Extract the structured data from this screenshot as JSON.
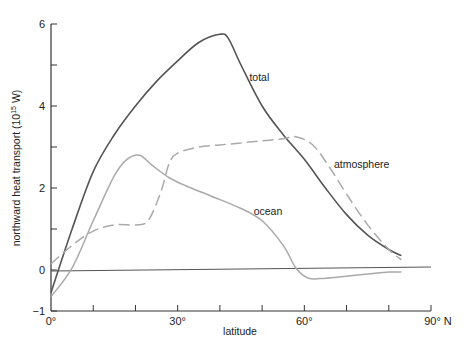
{
  "chart_data": {
    "type": "line",
    "title": "",
    "xlabel": "latitude",
    "ylabel": "northward heat transport (10^15 W)",
    "ylabel_parts": {
      "main": "northward heat transport (10",
      "sup": "15",
      "tail": " W)"
    },
    "xlim": [
      0,
      90
    ],
    "ylim": [
      -1,
      6
    ],
    "x_ticks": [
      0,
      10,
      20,
      30,
      40,
      50,
      60,
      70,
      80,
      90
    ],
    "x_tick_labels": [
      {
        "x": 0,
        "label": "0°"
      },
      {
        "x": 30,
        "label": "30°"
      },
      {
        "x": 60,
        "label": "60°"
      },
      {
        "x": 90,
        "label": "90° N"
      }
    ],
    "y_ticks": [
      -1,
      0,
      1,
      2,
      3,
      4,
      5,
      6
    ],
    "y_tick_labels": [
      {
        "y": -1,
        "label": "−1"
      },
      {
        "y": 0,
        "label": "0"
      },
      {
        "y": 2,
        "label": "2"
      },
      {
        "y": 4,
        "label": "4"
      },
      {
        "y": 6,
        "label": "6"
      }
    ],
    "grid": false,
    "legend": "inline labels",
    "series": [
      {
        "name": "total",
        "color": "#555555",
        "style": "solid",
        "x": [
          0,
          5,
          10,
          15,
          20,
          25,
          30,
          35,
          40,
          42,
          45,
          50,
          55,
          60,
          65,
          70,
          75,
          80,
          83
        ],
        "y": [
          -0.55,
          1.0,
          2.4,
          3.3,
          4.0,
          4.6,
          5.1,
          5.55,
          5.75,
          5.65,
          5.0,
          4.0,
          3.3,
          2.7,
          2.0,
          1.35,
          0.85,
          0.5,
          0.35
        ]
      },
      {
        "name": "atmosphere",
        "color": "#aaaaaa",
        "style": "dashed",
        "x": [
          0,
          5,
          10,
          15,
          20,
          23,
          26,
          28,
          30,
          35,
          40,
          45,
          50,
          55,
          58,
          62,
          66,
          70,
          75,
          80,
          83
        ],
        "y": [
          0.15,
          0.6,
          0.95,
          1.1,
          1.1,
          1.2,
          1.9,
          2.6,
          2.85,
          3.0,
          3.05,
          3.1,
          3.15,
          3.2,
          3.25,
          3.05,
          2.5,
          1.85,
          1.1,
          0.5,
          0.25
        ]
      },
      {
        "name": "ocean",
        "color": "#aaaaaa",
        "style": "solid",
        "x": [
          0,
          5,
          10,
          15,
          18,
          21,
          24,
          28,
          32,
          38,
          45,
          50,
          55,
          58,
          61,
          65,
          70,
          75,
          80,
          83
        ],
        "y": [
          -0.65,
          0.05,
          1.2,
          2.3,
          2.7,
          2.8,
          2.55,
          2.25,
          2.05,
          1.8,
          1.5,
          1.2,
          0.6,
          0.05,
          -0.2,
          -0.2,
          -0.15,
          -0.1,
          -0.05,
          -0.05
        ]
      }
    ],
    "annotations": [
      {
        "text": "total",
        "x": 47,
        "y": 4.6
      },
      {
        "text": "atmosphere",
        "x": 67,
        "y": 2.5
      },
      {
        "text": "ocean",
        "x": 48,
        "y": 1.35
      }
    ]
  }
}
